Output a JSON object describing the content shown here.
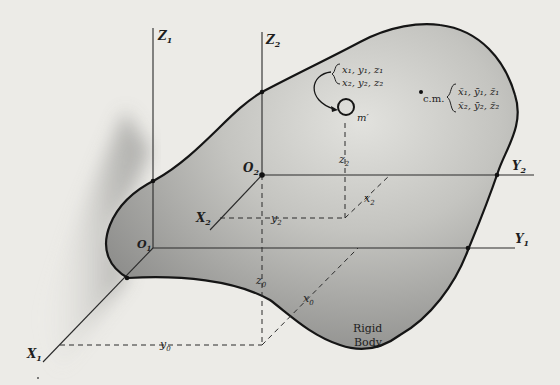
{
  "figure": {
    "body_label_line1": "Rigid",
    "body_label_line2": "Body",
    "colors": {
      "background": "#ecebe7",
      "body_fill_dark": "#9c9c9a",
      "body_fill_light": "#dcdcd8",
      "ink": "#1e1e1e"
    }
  },
  "frame1": {
    "origin": "O",
    "origin_sub": "1",
    "x_axis": "X",
    "x_sub": "1",
    "y_axis": "Y",
    "y_sub": "1",
    "z_axis": "Z",
    "z_sub": "1"
  },
  "frame2": {
    "origin": "O",
    "origin_sub": "2",
    "x_axis": "X",
    "x_sub": "2",
    "y_axis": "Y",
    "y_sub": "2",
    "z_axis": "Z",
    "z_sub": "2"
  },
  "offsets": {
    "x0": "x",
    "y0": "y",
    "z0": "z",
    "sub0": "0",
    "x2": "x",
    "y2": "y",
    "z2": "z",
    "sub2": "2"
  },
  "particle": {
    "label": "m′",
    "coords_line1": "x₁, y₁, z₁",
    "coords_line2": "x₂, y₂, z₂"
  },
  "center_of_mass": {
    "label": "c.m.",
    "coords_line1": "x̄₁, ȳ₁, z̄₁",
    "coords_line2": "x̄₂, ȳ₂, z̄₂"
  }
}
